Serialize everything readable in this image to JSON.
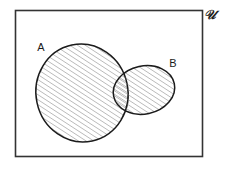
{
  "figure": {
    "universe": {
      "label": "U",
      "label_display": "𝒰",
      "name": "universal-set",
      "border_color": "#333333",
      "fill_color": "#ffffff",
      "rect": {
        "x": 15,
        "y": 10,
        "width": 188,
        "height": 147
      }
    },
    "sets": [
      {
        "id": "A",
        "label": "A",
        "name": "set-a",
        "shaded": true,
        "outline_color": "#1b1b1b",
        "hatch_color": "#6f6f6f",
        "label_position": {
          "x": 44,
          "y": 50
        },
        "ellipse": {
          "cx": 82,
          "cy": 93,
          "rx": 46,
          "ry": 49,
          "rotation": -12
        }
      },
      {
        "id": "B",
        "label": "B",
        "name": "set-b",
        "shaded": true,
        "outline_color": "#1b1b1b",
        "hatch_color": "#6f6f6f",
        "label_position": {
          "x": 173,
          "y": 66
        },
        "ellipse": {
          "cx": 144,
          "cy": 90,
          "rx": 31,
          "ry": 24,
          "rotation": -12
        }
      }
    ],
    "shading": {
      "style": "diagonal-hatch",
      "angle_degrees": 45,
      "spacing_px": 3,
      "line_width_px": 0.6,
      "region": "A ∪ B"
    },
    "intersection": {
      "name": "intersection-region",
      "shaded": true,
      "description": "A ∩ B overlap region is shaded with the same hatch"
    }
  }
}
